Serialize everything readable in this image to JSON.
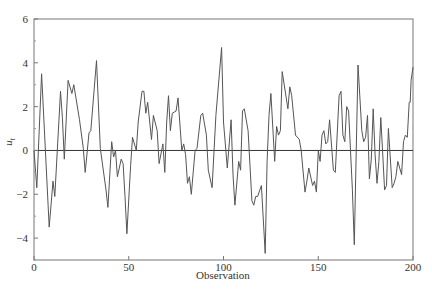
{
  "chart_data": {
    "type": "line",
    "title": "",
    "xlabel": "Observation",
    "ylabel": "u_t",
    "xlim": [
      0,
      200
    ],
    "ylim": [
      -5,
      6
    ],
    "xticks": [
      0,
      50,
      100,
      150,
      200
    ],
    "xtick_labels": [
      "0",
      "50",
      "100",
      "150",
      "200"
    ],
    "yticks": [
      -4,
      -2,
      0,
      2,
      4,
      6
    ],
    "ytick_labels": [
      "−4",
      "−2",
      "0",
      "2",
      "4",
      "6"
    ],
    "minor_yticks": [
      -5,
      -3,
      -1,
      1,
      3,
      5
    ],
    "grid": false,
    "legend": null,
    "reference_line": {
      "y": 0,
      "color": "#333333"
    },
    "line_color": "#555555",
    "keypoints": [
      [
        0,
        0.0
      ],
      [
        1.5,
        -1.7
      ],
      [
        4,
        3.5
      ],
      [
        8,
        -3.5
      ],
      [
        10,
        -1.4
      ],
      [
        11,
        -2.1
      ],
      [
        14,
        2.7
      ],
      [
        15,
        1.5
      ],
      [
        16,
        -0.4
      ],
      [
        18,
        3.2
      ],
      [
        20,
        2.6
      ],
      [
        21,
        3.0
      ],
      [
        24,
        1.4
      ],
      [
        26,
        0.1
      ],
      [
        27,
        -1.0
      ],
      [
        29,
        0.8
      ],
      [
        30,
        0.9
      ],
      [
        33,
        4.1
      ],
      [
        35,
        0.1
      ],
      [
        38,
        -1.8
      ],
      [
        39,
        -2.6
      ],
      [
        41,
        0.4
      ],
      [
        42,
        -0.3
      ],
      [
        43,
        0.0
      ],
      [
        44,
        -1.2
      ],
      [
        45,
        -0.8
      ],
      [
        46,
        -0.4
      ],
      [
        47,
        -0.6
      ],
      [
        48,
        -2.1
      ],
      [
        49,
        -3.8
      ],
      [
        51,
        -0.7
      ],
      [
        52,
        0.6
      ],
      [
        54,
        0.0
      ],
      [
        55,
        1.3
      ],
      [
        57,
        2.7
      ],
      [
        58,
        2.7
      ],
      [
        59,
        1.7
      ],
      [
        60,
        2.2
      ],
      [
        62,
        0.5
      ],
      [
        63,
        1.6
      ],
      [
        65,
        0.9
      ],
      [
        66,
        -0.6
      ],
      [
        68,
        0.3
      ],
      [
        69,
        -1.0
      ],
      [
        70,
        1.3
      ],
      [
        71,
        2.5
      ],
      [
        72,
        0.9
      ],
      [
        73,
        1.7
      ],
      [
        75,
        1.8
      ],
      [
        76,
        2.4
      ],
      [
        78,
        0.0
      ],
      [
        79,
        0.3
      ],
      [
        80,
        -0.2
      ],
      [
        81,
        -1.5
      ],
      [
        82,
        -1.2
      ],
      [
        83,
        -2.0
      ],
      [
        85,
        0.0
      ],
      [
        86,
        0.1
      ],
      [
        88,
        1.6
      ],
      [
        89,
        1.7
      ],
      [
        91,
        0.7
      ],
      [
        92,
        -0.9
      ],
      [
        94,
        -1.7
      ],
      [
        96,
        1.6
      ],
      [
        99,
        4.7
      ],
      [
        100,
        1.3
      ],
      [
        102,
        -0.8
      ],
      [
        104,
        1.4
      ],
      [
        105,
        -1.1
      ],
      [
        106,
        -2.5
      ],
      [
        108,
        -0.5
      ],
      [
        109,
        -0.9
      ],
      [
        110,
        1.8
      ],
      [
        111,
        1.9
      ],
      [
        113,
        0.9
      ],
      [
        115,
        -2.3
      ],
      [
        116,
        -2.5
      ],
      [
        117,
        -2.1
      ],
      [
        118,
        -2.1
      ],
      [
        120,
        -1.6
      ],
      [
        122,
        -4.7
      ],
      [
        123,
        -0.5
      ],
      [
        124,
        1.6
      ],
      [
        125,
        2.6
      ],
      [
        127,
        -0.5
      ],
      [
        128,
        1.1
      ],
      [
        129,
        0.7
      ],
      [
        130,
        0.9
      ],
      [
        131,
        3.6
      ],
      [
        134,
        1.9
      ],
      [
        135,
        2.9
      ],
      [
        136,
        2.5
      ],
      [
        138,
        0.7
      ],
      [
        140,
        0.5
      ],
      [
        141,
        0.0
      ],
      [
        143,
        -1.9
      ],
      [
        144,
        -1.4
      ],
      [
        145,
        -0.8
      ],
      [
        147,
        -1.6
      ],
      [
        148,
        -1.4
      ],
      [
        149,
        -1.9
      ],
      [
        150,
        0.0
      ],
      [
        151,
        -0.5
      ],
      [
        152,
        0.7
      ],
      [
        153,
        0.9
      ],
      [
        154,
        0.3
      ],
      [
        155,
        0.4
      ],
      [
        156,
        1.4
      ],
      [
        158,
        -0.9
      ],
      [
        159,
        -1.0
      ],
      [
        161,
        2.5
      ],
      [
        162,
        2.7
      ],
      [
        163,
        0.7
      ],
      [
        164,
        0.4
      ],
      [
        165,
        2.0
      ],
      [
        166,
        1.8
      ],
      [
        168,
        -1.8
      ],
      [
        169,
        -4.3
      ],
      [
        171,
        3.9
      ],
      [
        173,
        0.9
      ],
      [
        174,
        0.4
      ],
      [
        175,
        0.6
      ],
      [
        176,
        1.6
      ],
      [
        177,
        -1.3
      ],
      [
        178,
        -0.4
      ],
      [
        179,
        1.9
      ],
      [
        180,
        -0.2
      ],
      [
        181,
        -1.5
      ],
      [
        182,
        -0.5
      ],
      [
        183,
        1.5
      ],
      [
        185,
        -1.8
      ],
      [
        186,
        -1.6
      ],
      [
        187,
        1.0
      ],
      [
        189,
        -1.7
      ],
      [
        190,
        -1.5
      ],
      [
        191,
        -1.2
      ],
      [
        192,
        -0.5
      ],
      [
        193,
        -0.8
      ],
      [
        194,
        -1.1
      ],
      [
        195,
        0.4
      ],
      [
        196,
        0.7
      ],
      [
        197,
        0.6
      ],
      [
        198,
        2.2
      ],
      [
        198.5,
        2.2
      ],
      [
        199,
        3.2
      ],
      [
        200,
        3.8
      ]
    ],
    "x": [],
    "values": []
  },
  "layout": {
    "plot_left": 34,
    "plot_right": 413,
    "plot_top": 19,
    "plot_bottom": 260
  }
}
